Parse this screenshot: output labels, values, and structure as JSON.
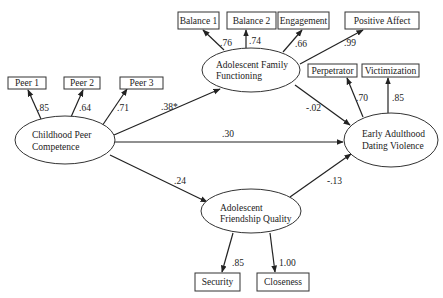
{
  "diagram": {
    "type": "structural-equation-model",
    "latent_constructs": [
      {
        "id": "childhood_peer",
        "line1": "Childhood Peer",
        "line2": "Competence"
      },
      {
        "id": "family",
        "line1": "Adolescent Family",
        "line2": "Functioning"
      },
      {
        "id": "friendship",
        "line1": "Adolescent",
        "line2": "Friendship Quality"
      },
      {
        "id": "dating_violence",
        "line1": "Early Adulthood",
        "line2": "Dating Violence"
      }
    ],
    "indicators": {
      "peer1": "Peer 1",
      "peer2": "Peer 2",
      "peer3": "Peer 3",
      "balance1": "Balance 1",
      "balance2": "Balance 2",
      "engagement": "Engagement",
      "positive_affect": "Positive Affect",
      "perpetrator": "Perpetrator",
      "victimization": "Victimization",
      "security": "Security",
      "closeness": "Closeness"
    },
    "loadings": {
      "peer1": ".85",
      "peer2": ".64",
      "peer3": ".71",
      "balance1": ".76",
      "balance2": ".74",
      "engagement": ".66",
      "positive_affect": ".99",
      "perpetrator": ".70",
      "victimization": ".85",
      "security": ".85",
      "closeness": "1.00"
    },
    "paths": {
      "peer_to_family": ".38*",
      "peer_to_dating": ".30",
      "peer_to_friendship": ".24",
      "family_to_dating": "-.02",
      "friendship_to_dating": "-.13"
    }
  }
}
